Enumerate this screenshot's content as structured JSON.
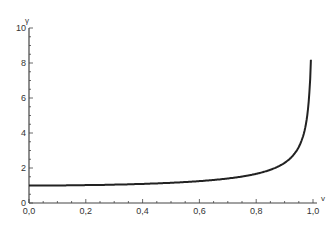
{
  "chart_data": {
    "type": "line",
    "title": "",
    "xlabel": "v",
    "ylabel": "γ",
    "xlim": [
      0,
      1
    ],
    "ylim": [
      0,
      10
    ],
    "grid": false,
    "legend": null,
    "x_ticks": [
      "0,0",
      "0,2",
      "0,4",
      "0,6",
      "0,8",
      "1,0"
    ],
    "y_ticks": [
      "0",
      "2",
      "4",
      "6",
      "8",
      "10"
    ],
    "series": [
      {
        "name": "γ = 1/√(1−v²)",
        "x": [
          0.0,
          0.1,
          0.2,
          0.3,
          0.4,
          0.5,
          0.6,
          0.7,
          0.8,
          0.85,
          0.9,
          0.93,
          0.95,
          0.97,
          0.98,
          0.99,
          0.995
        ],
        "values": [
          1.0,
          1.005,
          1.021,
          1.048,
          1.091,
          1.155,
          1.25,
          1.4,
          1.667,
          1.898,
          2.294,
          2.72,
          3.203,
          4.113,
          5.025,
          7.089,
          10.01
        ]
      }
    ]
  }
}
